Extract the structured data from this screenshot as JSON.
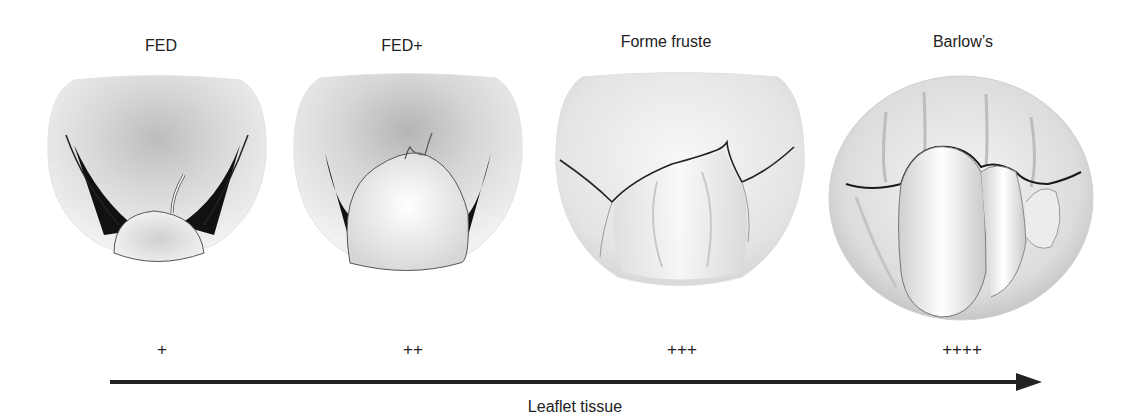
{
  "figure": {
    "stages": [
      {
        "title": "FED",
        "grade": "+"
      },
      {
        "title": "FED+",
        "grade": "++"
      },
      {
        "title": "Forme fruste",
        "grade": "+++"
      },
      {
        "title": "Barlow’s",
        "grade": "++++"
      }
    ],
    "axis": {
      "label": "Leaflet tissue",
      "direction": "increasing-right"
    },
    "colors": {
      "ink": "#222222",
      "tissue_light": "#f2f2f2",
      "tissue_mid": "#c8c8c8",
      "tissue_dark": "#8a8a8a",
      "gap": "#111111"
    }
  }
}
